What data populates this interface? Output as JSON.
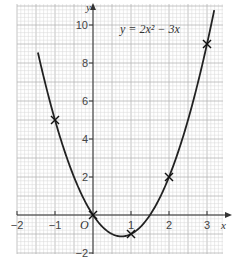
{
  "chart_data": {
    "type": "line",
    "title": "y = 2x² − 3x",
    "equation_label": "y = 2x² − 3x",
    "xlabel": "x",
    "ylabel": "y",
    "origin_label": "O",
    "xlim": [
      -2,
      3.2
    ],
    "ylim": [
      -2.1,
      10.8
    ],
    "grid": true,
    "x_ticks": [
      -2,
      -1,
      1,
      2,
      3
    ],
    "x_tick_labels": [
      "−2",
      "−1",
      "1",
      "2",
      "3"
    ],
    "y_ticks": [
      -2,
      2,
      4,
      6,
      8,
      10
    ],
    "y_tick_labels": [
      "−2",
      "2",
      "4",
      "6",
      "8",
      "10"
    ],
    "series": [
      {
        "name": "y = 2x² − 3x",
        "kind": "curve",
        "function": "2x^2 - 3x",
        "x_range": [
          -1.45,
          3.2
        ]
      }
    ],
    "marked_points": [
      {
        "x": -1,
        "y": 5
      },
      {
        "x": 0,
        "y": 0
      },
      {
        "x": 1,
        "y": -1
      },
      {
        "x": 2,
        "y": 2
      },
      {
        "x": 3,
        "y": 9
      }
    ]
  },
  "colors": {
    "grid_minor": "#d8d8d8",
    "grid_major": "#b5b5b5",
    "axis": "#333333",
    "curve": "#222222"
  }
}
